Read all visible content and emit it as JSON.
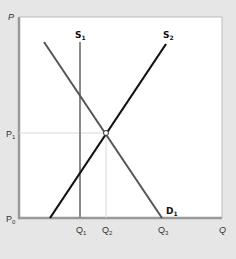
{
  "diagram": {
    "type": "supply-demand",
    "axes": {
      "y_label": "P",
      "x_label": "Q"
    },
    "price_labels": [
      "P",
      "P1",
      "P0"
    ],
    "quantity_labels": [
      "Q1",
      "Q2",
      "Q3",
      "Q"
    ],
    "curves": [
      {
        "name": "S1",
        "label": "S",
        "sub": "1",
        "color": "#8a8a8a",
        "kind": "vertical"
      },
      {
        "name": "S2",
        "label": "S",
        "sub": "2",
        "color": "#111111",
        "kind": "upward"
      },
      {
        "name": "D1",
        "label": "D",
        "sub": "1",
        "color": "#555555",
        "kind": "downward"
      }
    ],
    "equilibrium": {
      "price": "P1",
      "quantity": "Q2"
    }
  },
  "labels": {
    "P": "P",
    "P1_main": "P",
    "P1_sub": "1",
    "P0_main": "P",
    "P0_sub": "0",
    "Q1_main": "Q",
    "Q1_sub": "1",
    "Q2_main": "Q",
    "Q2_sub": "2",
    "Q3_main": "Q",
    "Q3_sub": "3",
    "Q": "Q",
    "S1_main": "S",
    "S1_sub": "1",
    "S2_main": "S",
    "S2_sub": "2",
    "D1_main": "D",
    "D1_sub": "1"
  }
}
